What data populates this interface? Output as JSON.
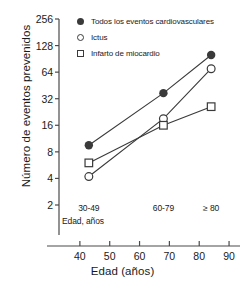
{
  "chart_data": {
    "type": "line",
    "title": "",
    "xlabel": "Edad (años)",
    "ylabel": "Número de eventos prevenidos",
    "xlim": [
      33,
      93
    ],
    "ylim": [
      2,
      256
    ],
    "yscale": "log2",
    "grid": false,
    "legend_position": "top-left",
    "xticks": [
      "40",
      "50",
      "60",
      "70",
      "80",
      "90"
    ],
    "xtick_values": [
      40,
      50,
      60,
      70,
      80,
      90
    ],
    "yticks": [
      "2",
      "4",
      "8",
      "16",
      "32",
      "64",
      "128",
      "256"
    ],
    "ytick_values": [
      2,
      4,
      8,
      16,
      32,
      64,
      128,
      256
    ],
    "group_labels": [
      "30-49",
      "60-79",
      "≥ 80"
    ],
    "group_label_x": [
      43,
      68,
      84
    ],
    "annotation": "Edad, años",
    "x": [
      43,
      68,
      84
    ],
    "series": [
      {
        "name": "Todos los eventos cardiovasculares",
        "marker": "filled-circle",
        "values": [
          9.5,
          37,
          100
        ]
      },
      {
        "name": "Ictus",
        "marker": "open-circle",
        "values": [
          4.2,
          19,
          70
        ]
      },
      {
        "name": "Infarto de miocardio",
        "marker": "open-square",
        "values": [
          6.0,
          16,
          26
        ]
      }
    ],
    "colors": {
      "ink": "#3a3a3a",
      "axis": "#4a4a4a",
      "marker_fill": "#3a3a3a",
      "marker_open": "#ffffff"
    }
  }
}
